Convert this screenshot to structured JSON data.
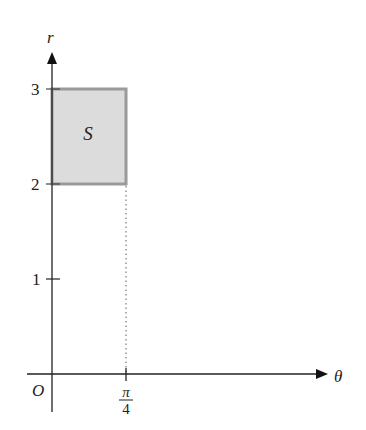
{
  "diagram": {
    "type": "polar-region-in-theta-r-plane",
    "axes": {
      "horizontal_label": "θ",
      "vertical_label": "r",
      "origin_label": "O"
    },
    "r_ticks": [
      {
        "value": 1,
        "label": "1"
      },
      {
        "value": 2,
        "label": "2"
      },
      {
        "value": 3,
        "label": "3"
      }
    ],
    "theta_ticks": [
      {
        "value": "π/4",
        "numerator": "π",
        "denominator": "4"
      }
    ],
    "region": {
      "label": "S",
      "theta_range": [
        "0",
        "π/4"
      ],
      "r_range": [
        2,
        3
      ],
      "fill_color": "#dcdcdc",
      "border_color": "#9a9a9a"
    },
    "guide_line": {
      "style": "dotted",
      "at_theta": "π/4",
      "from_r": 0,
      "to_r": 2
    }
  }
}
